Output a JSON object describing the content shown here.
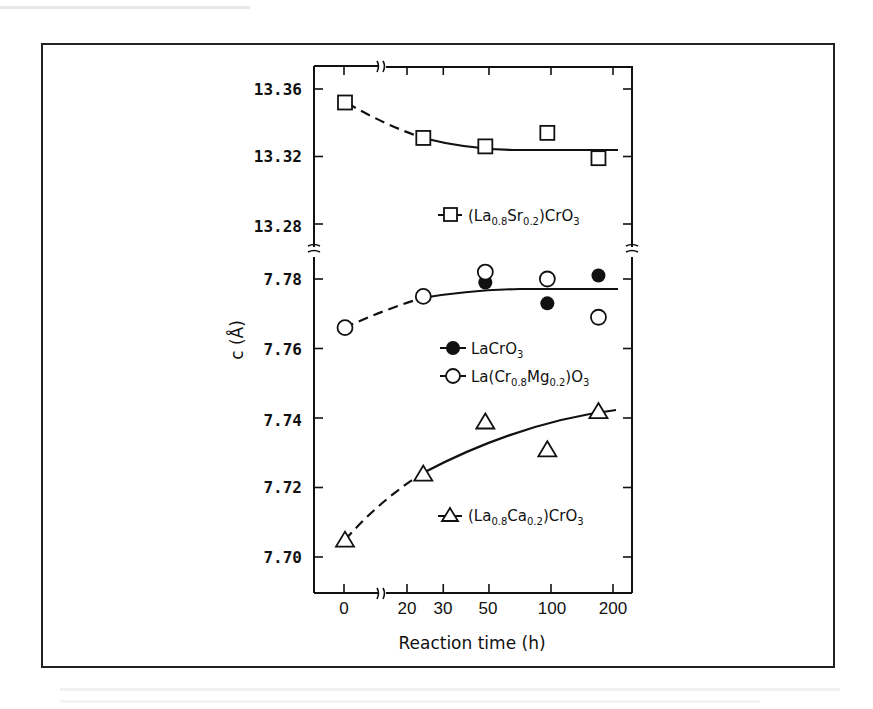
{
  "chart_data": {
    "type": "scatter",
    "title": "",
    "xlabel": "Reaction time (h)",
    "ylabel": "c (Å)",
    "x_scale": "broken-log (0 shown before axis break, then log-like 20–200)",
    "x_ticks": [
      0,
      20,
      30,
      50,
      100,
      200
    ],
    "y_axis_break": true,
    "y_upper": {
      "ticks": [
        13.36,
        13.32,
        13.28
      ],
      "range": [
        13.265,
        13.375
      ]
    },
    "y_lower": {
      "ticks": [
        7.78,
        7.76,
        7.74,
        7.72,
        7.7
      ],
      "range": [
        7.69,
        7.788
      ]
    },
    "grid": false,
    "legend_position": "inside, beside each series",
    "series": [
      {
        "name": "(La0.8Sr0.2)CrO3",
        "marker": "open-square",
        "panel": "upper",
        "x": [
          0,
          24,
          48,
          96,
          170
        ],
        "y": [
          13.352,
          13.331,
          13.326,
          13.334,
          13.319
        ],
        "fit": {
          "dashed_from": 0,
          "dashed_to": 24,
          "solid_to": 200,
          "y_end": 13.324
        }
      },
      {
        "name": "LaCrO3",
        "marker": "filled-circle",
        "panel": "lower",
        "x": [
          0,
          24,
          48,
          96,
          170
        ],
        "y": [
          7.766,
          7.775,
          7.779,
          7.773,
          7.781
        ]
      },
      {
        "name": "La(Cr0.8Mg0.2)O3",
        "marker": "open-circle",
        "panel": "lower",
        "x": [
          0,
          24,
          48,
          96,
          170
        ],
        "y": [
          7.766,
          7.775,
          7.782,
          7.78,
          7.769
        ]
      },
      {
        "name": "(La0.8Ca0.2)CrO3",
        "marker": "open-triangle",
        "panel": "lower",
        "x": [
          0,
          24,
          48,
          96,
          170
        ],
        "y": [
          7.705,
          7.724,
          7.739,
          7.731,
          7.742
        ]
      }
    ],
    "fit_curves": [
      {
        "for": "LaCrO3 / La(Cr0.8Mg0.2)O3",
        "start": 7.766,
        "end": 7.777,
        "dashed_segment": "0–24 h"
      },
      {
        "for": "(La0.8Ca0.2)CrO3",
        "start": 7.705,
        "end": 7.742,
        "dashed_segment": "0–24 h"
      }
    ]
  },
  "labels": {
    "xlabel": "Reaction time (h)",
    "ylabel": "c (Å)",
    "x_ticks": [
      "0",
      "20",
      "30",
      "50",
      "100",
      "200"
    ],
    "y_ticks_upper": [
      "13.36",
      "13.32",
      "13.28"
    ],
    "y_ticks_lower": [
      "7.78",
      "7.76",
      "7.74",
      "7.72",
      "7.70"
    ]
  },
  "legend": {
    "sr": {
      "main": "(La",
      "s1": "0.8",
      "m2": "Sr",
      "s2": "0.2",
      "m3": ")CrO",
      "s3": "3"
    },
    "la": {
      "main": "LaCrO",
      "s1": "3"
    },
    "mg": {
      "main": "La(Cr",
      "s1": "0.8",
      "m2": "Mg",
      "s2": "0.2",
      "m3": ")O",
      "s3": "3"
    },
    "ca": {
      "main": "(La",
      "s1": "0.8",
      "m2": "Ca",
      "s2": "0.2",
      "m3": ")CrO",
      "s3": "3"
    }
  }
}
